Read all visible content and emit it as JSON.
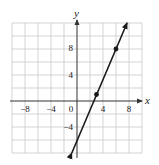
{
  "chart_data": {
    "type": "line",
    "title": "",
    "xlabel": "x",
    "ylabel": "y",
    "xlim": [
      -10,
      10
    ],
    "ylim": [
      -8,
      12
    ],
    "grid": true,
    "grid_step": 2,
    "x_ticks": [
      -8,
      -4,
      0,
      4,
      8
    ],
    "x_tick_labels": [
      "−8",
      "−4",
      "0",
      "4",
      "8"
    ],
    "y_ticks": [
      -4,
      4,
      8
    ],
    "y_tick_labels": [
      "−4",
      "4",
      "8"
    ],
    "series": [
      {
        "name": "line",
        "equation": "y = (7/3)x − 6",
        "slope": 2.333,
        "intercept": -6,
        "arrows": "both",
        "endpoints": [
          [
            -0.8,
            -8
          ],
          [
            7.7,
            12
          ]
        ],
        "marked_points": [
          [
            3,
            1
          ],
          [
            6,
            8
          ]
        ]
      }
    ],
    "colors": {
      "line": "#1a1a1a",
      "grid": "#c8c8c8",
      "axis": "#333333"
    }
  },
  "labels": {
    "x_axis": "x",
    "y_axis": "y",
    "ticks": {
      "x_m8": "−8",
      "x_m4": "−4",
      "x_0": "0",
      "x_4": "4",
      "x_8": "8",
      "y_8": "8",
      "y_4": "4",
      "y_m4": "−4"
    }
  }
}
